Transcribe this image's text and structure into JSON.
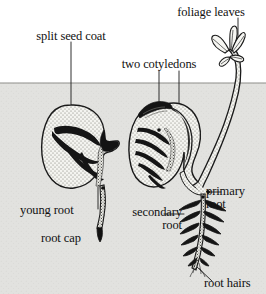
{
  "figure": {
    "width": 266,
    "height": 294,
    "colors": {
      "sky": "#ffffff",
      "soil": "#e2e2df",
      "ground_line": "#8d8d8a",
      "ink": "#111111",
      "seed_fill": "#f2f2ee",
      "seed_stipple": "#6b6b66",
      "dark_fill": "#151515"
    },
    "ground_line_y": 83
  },
  "labels": {
    "foliage_leaves": "foliage leaves",
    "split_seed_coat": "split seed coat",
    "two_cotyledons": "two cotyledons",
    "young_root": "young root",
    "root_cap": "root cap",
    "secondary_root_line1": "secondary",
    "secondary_root_line2": "root",
    "primary_root_line1": "primary",
    "primary_root_line2": "root",
    "root_hairs": "root hairs"
  },
  "parts": {
    "left_seedling_name": "early-germination-seed",
    "right_seedling_name": "later-germination-seedling"
  }
}
